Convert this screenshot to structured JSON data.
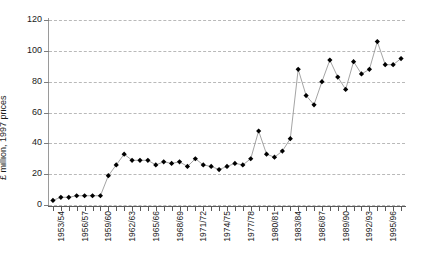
{
  "chart_data": {
    "type": "line",
    "title": "",
    "xlabel": "",
    "ylabel": "£ million, 1997 prices",
    "ylim": [
      0,
      120
    ],
    "yticks": [
      0,
      20,
      40,
      60,
      80,
      100,
      120
    ],
    "ytick_labels": [
      "0",
      "20",
      "40",
      "60",
      "80",
      "100",
      "120"
    ],
    "grid": true,
    "legend": "none",
    "marker": "filled-diamond",
    "x": [
      "1953/54",
      "1954/55",
      "1955/56",
      "1956/57",
      "1957/58",
      "1958/59",
      "1959/60",
      "1960/61",
      "1961/62",
      "1962/63",
      "1963/64",
      "1964/65",
      "1965/66",
      "1966/67",
      "1967/68",
      "1968/69",
      "1969/70",
      "1970/71",
      "1971/72",
      "1972/73",
      "1973/74",
      "1974/75",
      "1975/76",
      "1976/77",
      "1977/78",
      "1978/79",
      "1979/80",
      "1980/81",
      "1981/82",
      "1982/83",
      "1983/84",
      "1984/85",
      "1985/86",
      "1986/87",
      "1987/88",
      "1988/89",
      "1989/90",
      "1990/91",
      "1991/92",
      "1992/93",
      "1993/94",
      "1994/95",
      "1995/96",
      "1996/97",
      "1997/98"
    ],
    "xtick_labels": [
      "1953/54",
      "1956/57",
      "1959/60",
      "1962/63",
      "1965/66",
      "1968/69",
      "1971/72",
      "1974/75",
      "1977/78",
      "1980/81",
      "1983/84",
      "1986/87",
      "1989/90",
      "1992/93",
      "1995/96"
    ],
    "xtick_indices": [
      0,
      3,
      6,
      9,
      12,
      15,
      18,
      21,
      24,
      27,
      30,
      33,
      36,
      39,
      42
    ],
    "values": [
      3,
      5,
      5,
      6,
      6,
      6,
      6,
      19,
      26,
      33,
      29,
      29,
      29,
      26,
      28,
      27,
      28,
      25,
      30,
      26,
      25,
      23,
      25,
      27,
      26,
      30,
      48,
      33,
      31,
      35,
      43,
      88,
      71,
      65,
      80,
      94,
      83,
      75,
      93,
      85,
      88,
      106,
      91,
      91,
      95
    ],
    "color_series_line": "#8d8d8d",
    "color_marker": "#000000",
    "color_grid": "#b9b9b9",
    "color_axis": "#5a5a5a"
  }
}
